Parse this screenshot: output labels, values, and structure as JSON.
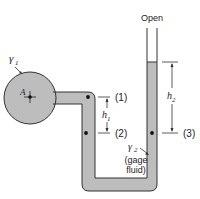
{
  "diagram": {
    "type": "manometer",
    "colors": {
      "fluid_fill": "#bdbdbd",
      "outline": "#333333",
      "background": "#ffffff"
    },
    "labels": {
      "open": "Open",
      "gamma1": "γ",
      "gamma1_sub": "1",
      "point_a": "A",
      "point1": "(1)",
      "point2": "(2)",
      "point3": "(3)",
      "h1": "h",
      "h1_sub": "1",
      "h2": "h",
      "h2_sub": "2",
      "gamma2": "γ",
      "gamma2_sub": "2",
      "gage_line1": "(gage",
      "gage_line2": "fluid)"
    }
  }
}
